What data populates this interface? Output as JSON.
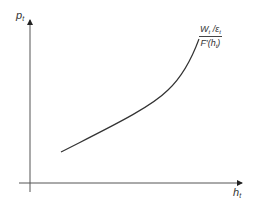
{
  "diagram": {
    "y_axis": {
      "label": "p",
      "subscript": "t"
    },
    "x_axis": {
      "label": "h",
      "subscript": "t"
    },
    "curve": {
      "label_numerator": {
        "main": "W",
        "sub": "t",
        "mid": " /ε",
        "sub2": "t"
      },
      "label_denominator": {
        "main": "F′(h",
        "sub": "t",
        "end": ")"
      },
      "shape": "convex increasing",
      "color": "#333333"
    }
  }
}
